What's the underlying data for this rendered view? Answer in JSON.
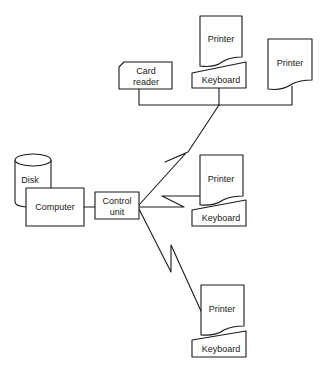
{
  "diagram": {
    "nodes": {
      "disk": {
        "label": "Disk"
      },
      "computer": {
        "label": "Computer"
      },
      "control_unit": {
        "line1": "Control",
        "line2": "unit"
      },
      "card_reader": {
        "line1": "Card",
        "line2": "reader"
      },
      "terminal_top": {
        "printer": "Printer",
        "keyboard": "Keyboard"
      },
      "printer_right": {
        "label": "Printer"
      },
      "terminal_middle": {
        "printer": "Printer",
        "keyboard": "Keyboard"
      },
      "terminal_bottom": {
        "printer": "Printer",
        "keyboard": "Keyboard"
      }
    },
    "edges": [
      {
        "from": "computer",
        "to": "control_unit",
        "type": "wire"
      },
      {
        "from": "control_unit",
        "to": "remote_bus",
        "type": "telecom-link"
      },
      {
        "from": "control_unit",
        "to": "terminal_middle",
        "type": "telecom-link"
      },
      {
        "from": "control_unit",
        "to": "terminal_bottom",
        "type": "telecom-link"
      },
      {
        "from": "remote_bus",
        "to": "card_reader",
        "type": "wire"
      },
      {
        "from": "remote_bus",
        "to": "terminal_top",
        "type": "wire"
      },
      {
        "from": "remote_bus",
        "to": "printer_right",
        "type": "wire"
      }
    ],
    "colors": {
      "stroke": "#1a1a1a",
      "background": "#ffffff"
    }
  }
}
